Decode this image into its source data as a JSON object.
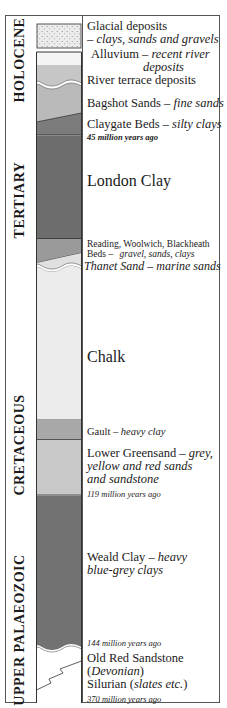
{
  "eras": [
    {
      "label": "HOLOCENE",
      "top": 20,
      "height": 80
    },
    {
      "label": "TERTIARY",
      "top": 140,
      "height": 120
    },
    {
      "label": "CRETACEOUS",
      "top": 385,
      "height": 120
    },
    {
      "label": "UPPER PALAEOZOIC",
      "top": 555,
      "height": 145
    }
  ],
  "colors": {
    "glacial": "#e6e6e6",
    "alluvium": "#f4f4f4",
    "terrace": "#c8c8c8",
    "bagshot": "#bdbdbd",
    "claygate": "#7a7a7a",
    "london_clay": "#6e6e6e",
    "reading_beds": "#9c9c9c",
    "thanet": "#e2e2e2",
    "chalk": "#ececec",
    "gault": "#a9a9a9",
    "lower_greensand": "#c9c9c9",
    "weald_clay": "#737373",
    "old_red": "#ffffff",
    "outline": "#333333"
  },
  "layers": {
    "glacial": {
      "name": "Glacial deposits",
      "desc": "– clays, sands and gravels"
    },
    "alluvium": {
      "name": "Alluvium – ",
      "desc": "recent river",
      "desc2": "deposits"
    },
    "terrace": {
      "name": "River terrace deposits"
    },
    "bagshot": {
      "name": "Bagshot Sands – ",
      "desc": "fine sands"
    },
    "claygate": {
      "name": "Claygate Beds – ",
      "desc": "silty clays"
    },
    "london_clay": {
      "name": "London Clay"
    },
    "reading": {
      "name": "Reading, Woolwich, Blackheath",
      "name2": "Beds – ",
      "desc": "gravel, sands, clays"
    },
    "thanet": {
      "name": "Thanet Sand – marine sands"
    },
    "chalk": {
      "name": "Chalk"
    },
    "gault": {
      "name": "Gault – ",
      "desc": "heavy clay"
    },
    "lower_greensand": {
      "name": "Lower Greensand – ",
      "desc": "grey,",
      "desc2": "yellow and red sands",
      "desc3": "and sandstone"
    },
    "weald_clay": {
      "name": "Weald Clay – ",
      "desc": "heavy",
      "desc2": "blue-grey clays"
    },
    "old_red": {
      "name": "Old Red Sandstone",
      "paren_open": "(",
      "desc": "Devonian",
      "paren_close": ")"
    },
    "silurian": {
      "name": "Silurian (",
      "desc": "slates etc.",
      "close": ")"
    }
  },
  "ages": {
    "a45": "45 million years ago",
    "a119": "119 million years ago",
    "a144": "144 million years ago",
    "a370": "370 million years ago"
  }
}
